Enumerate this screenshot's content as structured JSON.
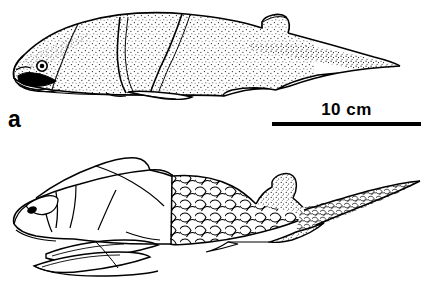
{
  "figure": {
    "background_color": "#ffffff",
    "ink_color": "#000000",
    "kind": "scientific-line-drawing"
  },
  "panels": [
    {
      "id": "a",
      "label": "a",
      "name": "panel-a",
      "description": "Lateral view of a heavily armoured fish with large head shield, segmented trunk plates, stippled shading, open mouth with dark interior, round eye, small dorsal ridge and heterocercal tail",
      "scalebar": {
        "label": "10 cm",
        "value": 10,
        "unit": "cm",
        "bar_color": "#000000"
      }
    },
    {
      "id": "b",
      "label": "b",
      "name": "panel-b",
      "description": "Lateral view of a fish with bony head plates, large rounded overlapping body scales, elongated paired ventral fins, stippled dorsal fin and long heterocercal tail",
      "scalebar": {
        "label": "10 cm",
        "value": 10,
        "unit": "cm",
        "bar_color": "#000000"
      }
    }
  ]
}
